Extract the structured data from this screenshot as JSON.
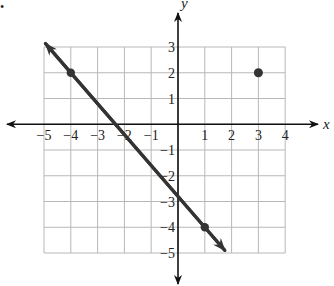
{
  "bullet": "•",
  "chart_data": {
    "type": "line",
    "title": "",
    "xlabel": "x",
    "ylabel": "y",
    "xlim": [
      -5,
      4
    ],
    "ylim": [
      -5,
      3
    ],
    "grid": true,
    "x_ticks": [
      -5,
      -4,
      -3,
      -2,
      -1,
      1,
      2,
      3,
      4
    ],
    "y_ticks": [
      3,
      2,
      1,
      -1,
      -2,
      -3,
      -4,
      -5
    ],
    "x_tick_labels": [
      "−5",
      "−4",
      "−3",
      "−2",
      "−1",
      "1",
      "2",
      "3",
      "4"
    ],
    "y_tick_labels": [
      "3",
      "2",
      "1",
      "−1",
      "−2",
      "−3",
      "−4",
      "−5"
    ],
    "series": [
      {
        "name": "line",
        "type": "line",
        "arrows_both_ends": true,
        "points": [
          {
            "x": -4,
            "y": 2
          },
          {
            "x": 1,
            "y": -4
          }
        ],
        "slope": -1.2,
        "intercept": -2.8
      },
      {
        "name": "point",
        "type": "scatter",
        "points": [
          {
            "x": 3,
            "y": 2
          }
        ]
      }
    ],
    "colors": {
      "grid": "#b8b8b8",
      "axis": "#111111",
      "line": "#333333",
      "point": "#333333"
    }
  }
}
